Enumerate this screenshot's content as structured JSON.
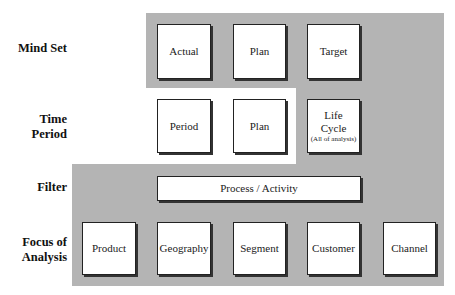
{
  "rows": [
    {
      "label": "Mind Set"
    },
    {
      "label_line1": "Time",
      "label_line2": "Period"
    },
    {
      "label": "Filter"
    },
    {
      "label_line1": "Focus of",
      "label_line2": "Analysis"
    }
  ],
  "mind_set": [
    "Actual",
    "Plan",
    "Target"
  ],
  "time_period": {
    "items": [
      "Period",
      "Plan"
    ],
    "life_cycle": {
      "line1": "Life",
      "line2": "Cycle",
      "note": "(All of analysis)"
    }
  },
  "filter": {
    "item": "Process / Activity"
  },
  "focus": [
    "Product",
    "Geography",
    "Segment",
    "Customer",
    "Channel"
  ],
  "colors": {
    "shaded_region": "#b4b4b4",
    "box_fill": "#ffffff",
    "box_border": "#222222"
  }
}
